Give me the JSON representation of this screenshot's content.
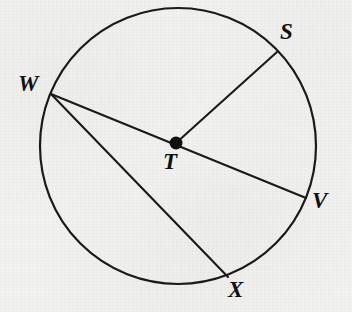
{
  "figure": {
    "kind": "geometry-diagram",
    "background_color": "#f2f2f0",
    "ink_color": "#1a1a1a"
  },
  "circle": {
    "name": "circle-T",
    "center_x": 178,
    "center_y": 146,
    "radius": 138,
    "stroke_width": 2.2
  },
  "center_point": {
    "label": "T",
    "x": 176,
    "y": 143,
    "dot_radius": 6.5,
    "label_x": 163,
    "label_y": 150
  },
  "points": [
    {
      "id": "S",
      "label": "S",
      "x": 277,
      "y": 52,
      "label_x": 280,
      "label_y": 20
    },
    {
      "id": "W",
      "label": "W",
      "x": 51,
      "y": 94,
      "label_x": 18,
      "label_y": 72
    },
    {
      "id": "V",
      "label": "V",
      "x": 306,
      "y": 198,
      "label_x": 312,
      "label_y": 189
    },
    {
      "id": "X",
      "label": "X",
      "x": 228,
      "y": 277,
      "label_x": 228,
      "label_y": 278
    }
  ],
  "segments": [
    {
      "id": "TS",
      "name": "radius-T-S",
      "x1": 176,
      "y1": 143,
      "x2": 277,
      "y2": 52,
      "kind": "radius"
    },
    {
      "id": "WV",
      "name": "diameter-W-V",
      "x1": 51,
      "y1": 94,
      "x2": 306,
      "y2": 198,
      "kind": "diameter"
    },
    {
      "id": "WX",
      "name": "chord-W-X",
      "x1": 51,
      "y1": 94,
      "x2": 228,
      "y2": 277,
      "kind": "chord"
    }
  ]
}
